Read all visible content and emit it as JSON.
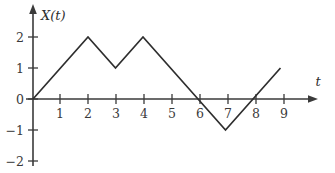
{
  "chart_data": {
    "type": "line",
    "title": "",
    "xlabel": "t",
    "ylabel": "X(t)",
    "xlim": [
      0,
      10.2
    ],
    "ylim": [
      -2.3,
      2.6
    ],
    "grid": false,
    "legend": null,
    "x_ticks": [
      1,
      2,
      3,
      4,
      5,
      6,
      7,
      8,
      9
    ],
    "x_tick_labels": [
      "1",
      "2",
      "3",
      "4",
      "5",
      "6",
      "7",
      "8",
      "9"
    ],
    "y_ticks": [
      2,
      1,
      0,
      -1,
      -2
    ],
    "y_tick_labels": [
      "2",
      "1",
      "0",
      "−1",
      "−2"
    ],
    "series": [
      {
        "name": "X(t)",
        "x": [
          0,
          2,
          3,
          4,
          6,
          7,
          9
        ],
        "values": [
          0,
          2,
          1,
          2,
          0,
          -1,
          1
        ]
      }
    ],
    "annotations": []
  },
  "axes": {
    "y_label": "X(t)",
    "x_label": "t"
  },
  "colors": {
    "signal": "#2e2e2e",
    "axis": "#3a3a3a",
    "background": "#ffffff"
  }
}
